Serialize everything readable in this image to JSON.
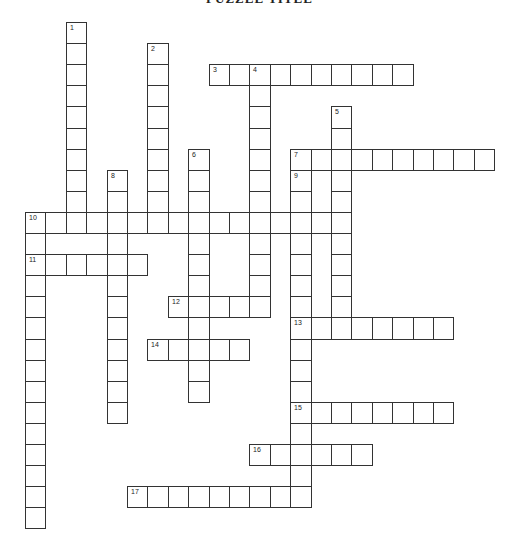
{
  "title": "PUZZLE TITLE",
  "grid": {
    "origin_x": 25,
    "origin_y": 22,
    "cell_w": 20.4,
    "cell_h": 21.1,
    "border_color": "#333333"
  },
  "words": [
    {
      "number": "1",
      "direction": "down",
      "col": 2,
      "row": 0,
      "length": 10
    },
    {
      "number": "2",
      "direction": "down",
      "col": 6,
      "row": 1,
      "length": 9
    },
    {
      "number": "3",
      "direction": "across",
      "col": 9,
      "row": 2,
      "length": 10
    },
    {
      "number": "4",
      "direction": "down",
      "col": 11,
      "row": 2,
      "length": 12
    },
    {
      "number": "5",
      "direction": "down",
      "col": 15,
      "row": 4,
      "length": 11
    },
    {
      "number": "6",
      "direction": "down",
      "col": 8,
      "row": 6,
      "length": 12
    },
    {
      "number": "7",
      "direction": "across",
      "col": 13,
      "row": 6,
      "length": 10
    },
    {
      "number": "8",
      "direction": "down",
      "col": 4,
      "row": 7,
      "length": 12
    },
    {
      "number": "9",
      "direction": "down",
      "col": 13,
      "row": 7,
      "length": 16
    },
    {
      "number": "10",
      "direction": "across",
      "col": 0,
      "row": 9,
      "length": 16
    },
    {
      "number": "10",
      "direction": "down",
      "col": 0,
      "row": 9,
      "length": 15
    },
    {
      "number": "11",
      "direction": "across",
      "col": 0,
      "row": 11,
      "length": 6
    },
    {
      "number": "12",
      "direction": "across",
      "col": 7,
      "row": 13,
      "length": 5
    },
    {
      "number": "13",
      "direction": "across",
      "col": 13,
      "row": 14,
      "length": 8
    },
    {
      "number": "14",
      "direction": "across",
      "col": 6,
      "row": 15,
      "length": 5
    },
    {
      "number": "15",
      "direction": "across",
      "col": 13,
      "row": 18,
      "length": 8
    },
    {
      "number": "16",
      "direction": "across",
      "col": 11,
      "row": 20,
      "length": 6
    },
    {
      "number": "17",
      "direction": "across",
      "col": 5,
      "row": 22,
      "length": 9
    }
  ]
}
